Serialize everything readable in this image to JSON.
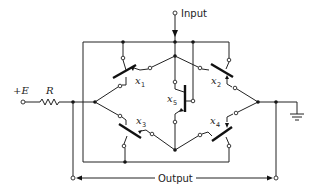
{
  "diagram": {
    "type": "bridge switching circuit",
    "labels": {
      "input": "Input",
      "output": "Output",
      "supply": "+E",
      "resistor": "R"
    },
    "switches": [
      {
        "name": "x",
        "sub": "1"
      },
      {
        "name": "x",
        "sub": "2"
      },
      {
        "name": "x",
        "sub": "3"
      },
      {
        "name": "x",
        "sub": "4"
      },
      {
        "name": "x",
        "sub": "5"
      }
    ],
    "colors": {
      "line": "#222222",
      "background": "#ffffff"
    }
  }
}
